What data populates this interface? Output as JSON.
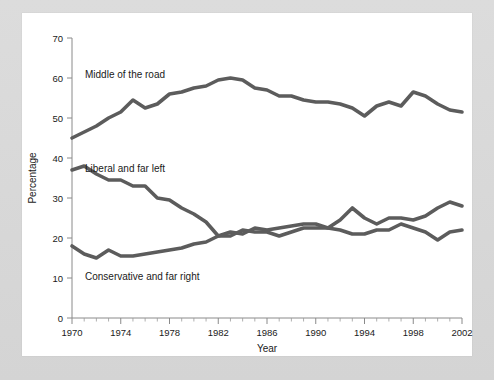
{
  "figure": {
    "background_color": "#d9d9d9",
    "card_color": "#ffffff",
    "line_color": "#5c5c5c"
  },
  "axes": {
    "x_title": "Year",
    "y_title": "Percentage",
    "y_ticks": [
      "0",
      "10",
      "20",
      "30",
      "40",
      "50",
      "60",
      "70"
    ],
    "x_ticks": [
      "1970",
      "1974",
      "1978",
      "1982",
      "1986",
      "1990",
      "1994",
      "1998",
      "2002"
    ]
  },
  "labels": {
    "middle": "Middle of the road",
    "liberal": "Liberal and far left",
    "conservative": "Conservative and far right"
  },
  "chart_data": {
    "type": "line",
    "title": "",
    "xlabel": "Year",
    "ylabel": "Percentage",
    "xlim": [
      1970,
      2002
    ],
    "ylim": [
      0,
      70
    ],
    "grid": false,
    "legend_position": "inline-annotations",
    "x": [
      1970,
      1971,
      1972,
      1973,
      1974,
      1975,
      1976,
      1977,
      1978,
      1979,
      1980,
      1981,
      1982,
      1983,
      1984,
      1985,
      1986,
      1987,
      1988,
      1989,
      1990,
      1991,
      1992,
      1993,
      1994,
      1995,
      1996,
      1997,
      1998,
      1999,
      2000,
      2001,
      2002
    ],
    "series": [
      {
        "name": "Middle of the road",
        "values": [
          45.0,
          46.5,
          48.0,
          50.0,
          51.5,
          54.5,
          52.5,
          53.5,
          56.0,
          56.5,
          57.5,
          58.0,
          59.5,
          60.0,
          59.5,
          57.5,
          57.0,
          55.5,
          55.5,
          54.5,
          54.0,
          54.0,
          53.5,
          52.5,
          50.5,
          53.0,
          54.0,
          53.0,
          56.5,
          55.5,
          53.5,
          52.0,
          51.5
        ]
      },
      {
        "name": "Liberal and far left",
        "values": [
          37.0,
          38.0,
          36.0,
          34.5,
          34.5,
          33.0,
          33.0,
          30.0,
          29.5,
          27.5,
          26.0,
          24.0,
          20.5,
          21.5,
          21.0,
          22.5,
          22.0,
          22.5,
          23.0,
          23.5,
          23.5,
          22.5,
          24.5,
          27.5,
          25.0,
          23.5,
          25.0,
          25.0,
          24.5,
          25.5,
          27.5,
          29.0,
          28.0
        ]
      },
      {
        "name": "Conservative and far right",
        "values": [
          18.0,
          16.0,
          15.0,
          17.0,
          15.5,
          15.5,
          16.0,
          16.5,
          17.0,
          17.5,
          18.5,
          19.0,
          20.5,
          20.5,
          22.0,
          21.5,
          21.5,
          20.5,
          21.5,
          22.5,
          22.5,
          22.5,
          22.0,
          21.0,
          21.0,
          22.0,
          22.0,
          23.5,
          22.5,
          21.5,
          19.5,
          21.5,
          22.0
        ]
      }
    ]
  }
}
